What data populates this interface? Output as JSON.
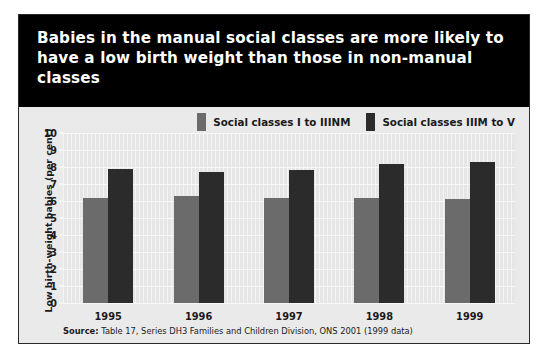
{
  "title": "Babies in the manual social classes are more likely to have a low birth weight than those in non-manual classes",
  "source": {
    "label": "Source:",
    "text": " Table 17, Series DH3 Families and Children Division, ONS 2001 (1999 data)"
  },
  "colors": {
    "header_background": "#000000",
    "header_text": "#ffffff",
    "panel_background": "#eaeaea",
    "plot_background": "#e6e6e6",
    "series_light": "#6b6b6b",
    "series_dark": "#2b2b2b"
  },
  "chart_data": {
    "type": "bar",
    "title": "Babies in the manual social classes are more likely to have a low birth weight than those in non-manual classes",
    "xlabel": "",
    "ylabel": "Low birth-weight babies (per cent)",
    "categories": [
      "1995",
      "1996",
      "1997",
      "1998",
      "1999"
    ],
    "series": [
      {
        "name": "Social classes I to IIINM",
        "color": "#6b6b6b",
        "values": [
          6.2,
          6.3,
          6.2,
          6.2,
          6.1
        ]
      },
      {
        "name": "Social classes IIIM to V",
        "color": "#2b2b2b",
        "values": [
          7.9,
          7.7,
          7.8,
          8.2,
          8.3
        ]
      }
    ],
    "ylim": [
      0,
      10
    ],
    "yticks": [
      0,
      1,
      2,
      3,
      4,
      5,
      6,
      7,
      8,
      9,
      10
    ],
    "ytick_labels": [
      "0",
      "1",
      "2",
      "3",
      "4",
      "5",
      "6",
      "7",
      "8",
      "9",
      "10"
    ],
    "grid": true,
    "legend_position": "top-right"
  }
}
